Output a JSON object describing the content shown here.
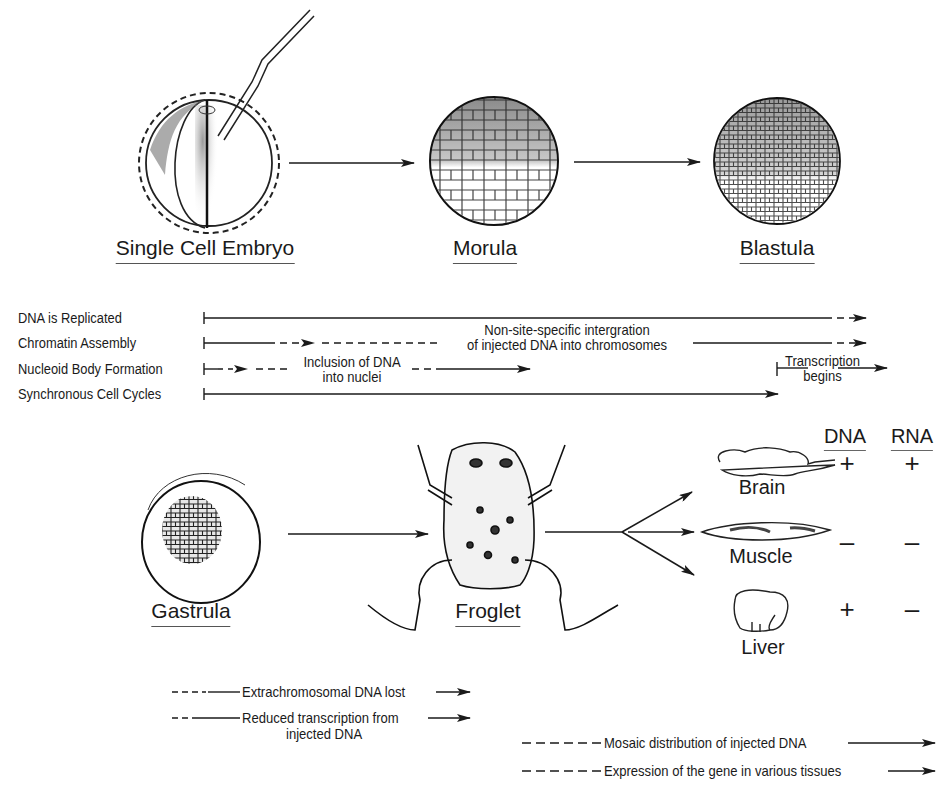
{
  "stages_top": [
    {
      "label": "Single Cell Embryo",
      "x": 205,
      "y": 230
    },
    {
      "label": "Morula",
      "x": 485,
      "y": 230
    },
    {
      "label": "Blastula",
      "x": 777,
      "y": 230
    }
  ],
  "stages_bottom": [
    {
      "label": "Gastrula",
      "x": 191,
      "y": 593
    },
    {
      "label": "Froglet",
      "x": 488,
      "y": 593
    }
  ],
  "timeline": {
    "rows": [
      {
        "label": "DNA is Replicated"
      },
      {
        "label": "Chromatin Assembly"
      },
      {
        "label": "Nucleoid Body Formation"
      },
      {
        "label": "Synchronous Cell Cycles"
      }
    ],
    "annotations": {
      "integration_line1": "Non-site-specific intergration",
      "integration_line2": "of injected DNA into chromosomes",
      "inclusion_line1": "Inclusion of DNA",
      "inclusion_line2": "into nuclei",
      "transcription_line1": "Transcription",
      "transcription_line2": "begins"
    }
  },
  "tissue_table": {
    "headers": {
      "dna": "DNA",
      "rna": "RNA"
    },
    "rows": [
      {
        "organ": "Brain",
        "dna": "+",
        "rna": "+"
      },
      {
        "organ": "Muscle",
        "dna": "–",
        "rna": "–"
      },
      {
        "organ": "Liver",
        "dna": "+",
        "rna": "–"
      }
    ]
  },
  "legend_left": [
    {
      "text": "Extrachromosomal DNA lost"
    },
    {
      "text_line1": "Reduced transcription from",
      "text_line2": "injected DNA"
    }
  ],
  "legend_right": [
    {
      "text": "Mosaic distribution of injected DNA"
    },
    {
      "text": "Expression of the gene in various tissues"
    }
  ]
}
